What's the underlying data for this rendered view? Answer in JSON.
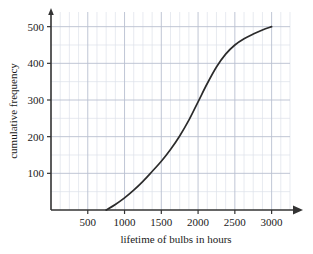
{
  "chart_data": {
    "type": "line",
    "title": "",
    "xlabel": "lifetime of bulbs in hours",
    "ylabel": "cumulative frequency",
    "xlim": [
      0,
      3250
    ],
    "ylim": [
      0,
      540
    ],
    "xticks": [
      500,
      1000,
      1500,
      2000,
      2500,
      3000
    ],
    "xtick_labels": [
      "500",
      "1000",
      "1500",
      "2000",
      "2500",
      "3000"
    ],
    "yticks": [
      100,
      200,
      300,
      400,
      500
    ],
    "ytick_labels": [
      "100",
      "200",
      "300",
      "400",
      "500"
    ],
    "grid": true,
    "grid_major_x_step": 500,
    "grid_minor_x_step": 125,
    "grid_major_y_step": 100,
    "grid_minor_y_step": 50,
    "legend": "none",
    "series": [
      {
        "name": "cumulative frequency of bulb lifetimes",
        "color": "#2b2b2b",
        "x": [
          750,
          875,
          1000,
          1125,
          1250,
          1375,
          1500,
          1625,
          1750,
          1875,
          2000,
          2125,
          2250,
          2375,
          2500,
          2625,
          2750,
          2875,
          3000
        ],
        "y": [
          0,
          15,
          33,
          54,
          78,
          105,
          133,
          165,
          202,
          245,
          295,
          345,
          390,
          425,
          450,
          467,
          480,
          491,
          500
        ]
      }
    ],
    "annotations": {
      "x_axis_arrow": true,
      "y_axis_arrow": true,
      "curve_start_point": [
        750,
        0
      ],
      "curve_end_point": [
        3000,
        500
      ]
    }
  },
  "axis": {
    "x_label": "lifetime of bulbs in hours",
    "y_label": "cumulative frequency"
  },
  "colors": {
    "curve": "#2b2b2b",
    "axis": "#333333",
    "grid_major": "#b9bfd0",
    "grid_minor": "#dde1ea",
    "text": "#1a1a1a",
    "background": "#ffffff"
  }
}
